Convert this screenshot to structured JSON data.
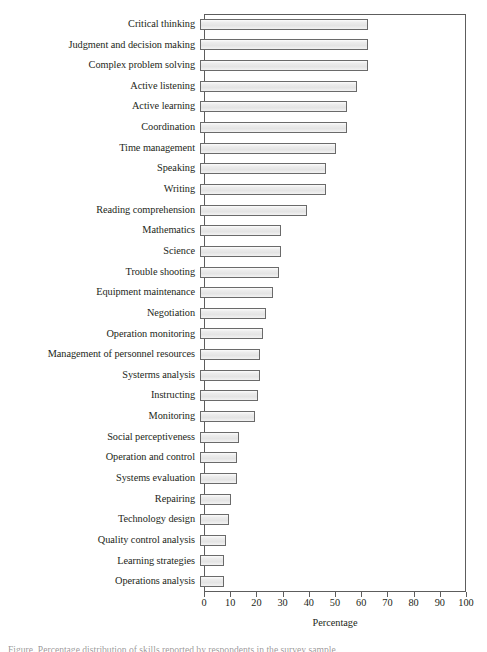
{
  "chart_data": {
    "type": "bar",
    "orientation": "horizontal",
    "title": "",
    "xlabel": "Percentage",
    "ylabel": "",
    "xlim": [
      0,
      100
    ],
    "xticks": [
      0,
      10,
      20,
      30,
      40,
      50,
      60,
      70,
      80,
      90,
      100
    ],
    "grid": false,
    "legend": null,
    "categories": [
      "Critical thinking",
      "Judgment and decision making",
      "Complex problem solving",
      "Active listening",
      "Active learning",
      "Coordination",
      "Time management",
      "Speaking",
      "Writing",
      "Reading comprehension",
      "Mathematics",
      "Science",
      "Trouble shooting",
      "Equipment maintenance",
      "Negotiation",
      "Operation monitoring",
      "Management of personnel resources",
      "Systerms analysis",
      "Instructing",
      "Monitoring",
      "Social perceptiveness",
      "Operation and control",
      "Systems evaluation",
      "Repairing",
      "Technology design",
      "Quality control analysis",
      "Learning strategies",
      "Operations analysis"
    ],
    "values": [
      64,
      64,
      64,
      60,
      56,
      56,
      52,
      48,
      48,
      41,
      31,
      31,
      30,
      28,
      25,
      24,
      23,
      23,
      22,
      21,
      15,
      14,
      14,
      12,
      11,
      10,
      9,
      9
    ]
  },
  "axis": {
    "x_title": "Percentage",
    "tick_labels": [
      "0",
      "10",
      "20",
      "30",
      "40",
      "50",
      "60",
      "70",
      "80",
      "90",
      "100"
    ]
  },
  "caption": {
    "text": "Figure. Percentage distribution of skills reported by respondents in the survey sample."
  },
  "colors": {
    "bar_fill": "#e8e8e8",
    "bar_border": "#6a6a6a",
    "axis": "#5d5d5d",
    "text": "#231f20",
    "background": "#ffffff"
  }
}
